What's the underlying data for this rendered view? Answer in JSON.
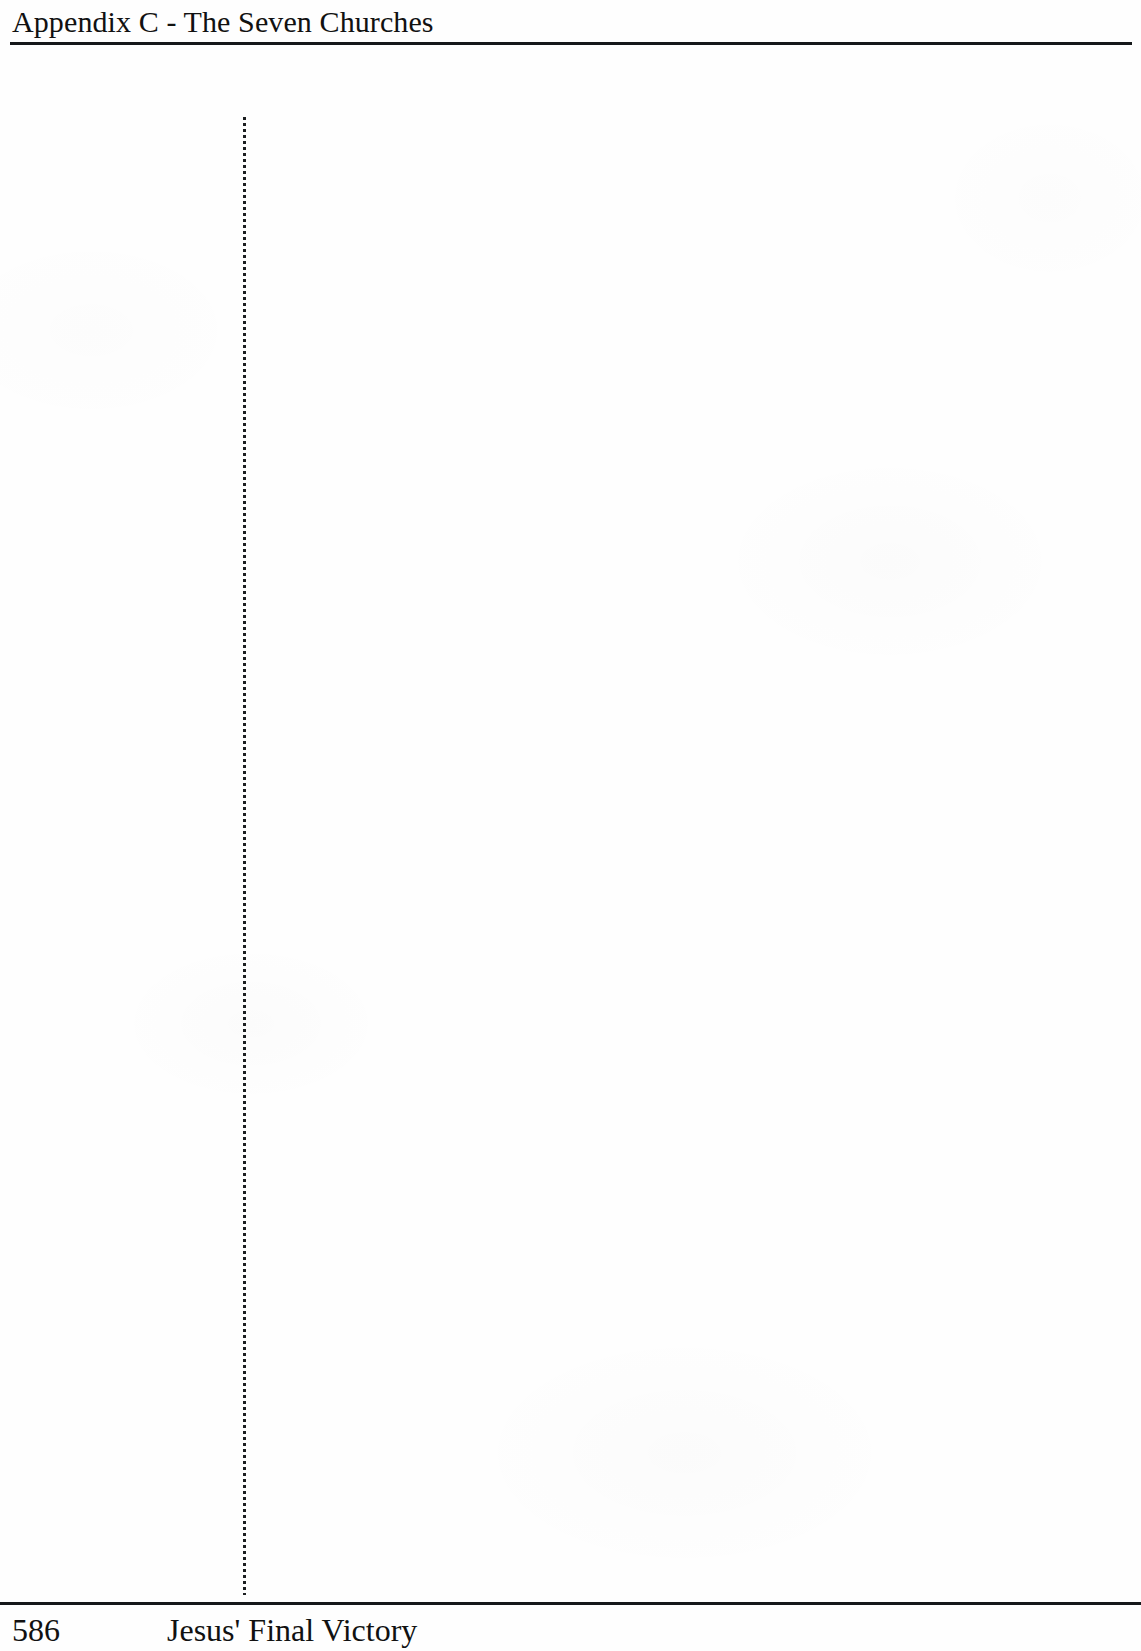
{
  "page": {
    "background_color": "#fefefe",
    "ink_color": "#15181a",
    "width": 1141,
    "height": 1651
  },
  "header": {
    "running_head": "Appendix C - The Seven Churches",
    "rule": {
      "name": "header-rule",
      "color": "#15181a"
    }
  },
  "body": {
    "content": "",
    "column_rule": {
      "name": "vertical-dotted-rule",
      "style": "dotted",
      "color": "#1b1e20"
    }
  },
  "footer": {
    "rule": {
      "name": "footer-rule",
      "color": "#15181a"
    },
    "page_number": "586",
    "book_title": "Jesus' Final Victory"
  }
}
